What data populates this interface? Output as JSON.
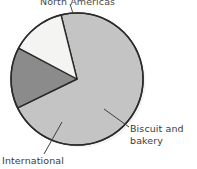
{
  "chart_data": {
    "type": "pie",
    "title": "North Americas",
    "subtitle": "",
    "xlabel": "",
    "ylabel": "",
    "grid": false,
    "legend": "none",
    "labels_position": "outside-with-leader-lines",
    "categories": [
      "North Americas",
      "International",
      "Biscuit and bakery"
    ],
    "values": [
      71.7,
      15.0,
      13.3
    ],
    "units": "percent",
    "slices": [
      {
        "label": "North Americas",
        "value": 71.7,
        "start_angle_deg": 346,
        "end_angle_deg": 244,
        "sweep_deg": 258,
        "color": "#c4c4c4"
      },
      {
        "label": "International",
        "value": 15.0,
        "start_angle_deg": 244,
        "end_angle_deg": 298,
        "sweep_deg": 54,
        "color": "#8b8b8b"
      },
      {
        "label": "Biscuit and bakery",
        "value": 13.3,
        "start_angle_deg": 298,
        "end_angle_deg": 346,
        "sweep_deg": 48,
        "color": "#f4f4f2"
      }
    ],
    "annotations": [
      {
        "text": "North Americas",
        "position": "top",
        "clipped": true
      },
      {
        "text": "Biscuit and bakery",
        "position": "right",
        "lines": [
          "Biscuit and",
          "bakery"
        ]
      },
      {
        "text": "International",
        "position": "bottom-left",
        "lines": [
          "International"
        ]
      }
    ]
  },
  "labels": {
    "north_americas": "North Americas",
    "biscuit_and_bakery_line1": "Biscuit and",
    "biscuit_and_bakery_line2": "bakery",
    "international": "International"
  },
  "colors": {
    "slice_north_americas": "#c4c4c4",
    "slice_international": "#8b8b8b",
    "slice_biscuit_bakery": "#f4f4f2",
    "outline": "#2b2b2b",
    "leader_line": "#3d3d3d",
    "label_text": "#3a3a3a",
    "background": "#ffffff"
  },
  "geometry": {
    "center_x": 77,
    "center_y": 79,
    "radius": 66
  }
}
